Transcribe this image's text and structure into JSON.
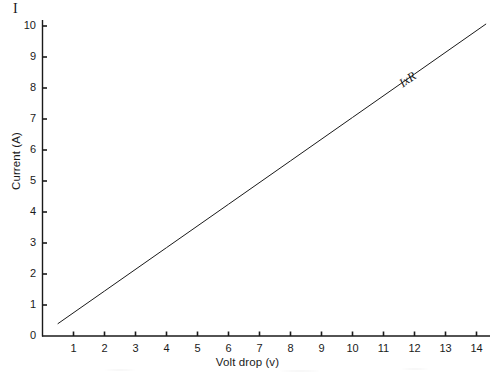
{
  "figure": {
    "symbol_label": "I",
    "background_color": "#ffffff",
    "ink_color": "#1a1a1a"
  },
  "chart_data": {
    "type": "line",
    "title": "",
    "subtitle": "",
    "xlabel": "Volt drop (v)",
    "ylabel": "Current (A)",
    "xlim": [
      0,
      14.8
    ],
    "ylim": [
      0,
      10.2
    ],
    "xticks": [
      1,
      2,
      3,
      4,
      5,
      6,
      7,
      8,
      9,
      10,
      11,
      12,
      13,
      14
    ],
    "xtick_labels": [
      "1",
      "2",
      "3",
      "4",
      "5",
      "6",
      "7",
      "8",
      "9",
      "10",
      "11",
      "12",
      "13",
      "14"
    ],
    "yticks": [
      0,
      1,
      2,
      3,
      4,
      5,
      6,
      7,
      8,
      9,
      10
    ],
    "ytick_labels": [
      "0",
      "1",
      "2",
      "3",
      "4",
      "5",
      "6",
      "7",
      "8",
      "9",
      "10"
    ],
    "grid": false,
    "legend_position": "none",
    "series": [
      {
        "name": "IxR",
        "label_text": "IxR",
        "color": "#1a1a1a",
        "line_width": 1,
        "style": "solid",
        "slope": 0.7,
        "intercept": 0.05,
        "x": [
          0.5,
          14.3
        ],
        "values": [
          0.4,
          10.06
        ],
        "points": [
          {
            "x": 0.5,
            "y": 0.4
          },
          {
            "x": 2,
            "y": 1.45
          },
          {
            "x": 4,
            "y": 2.85
          },
          {
            "x": 6,
            "y": 4.25
          },
          {
            "x": 8,
            "y": 5.65
          },
          {
            "x": 10,
            "y": 7.05
          },
          {
            "x": 12,
            "y": 8.45
          },
          {
            "x": 14.3,
            "y": 10.06
          }
        ]
      }
    ],
    "annotations": [
      {
        "text": "IxR",
        "x": 11.7,
        "y": 8.0,
        "rotation_deg": -35,
        "style": "italic-serif"
      }
    ]
  }
}
